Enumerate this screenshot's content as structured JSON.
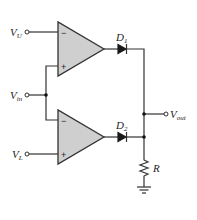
{
  "diagram": {
    "type": "window comparator circuit",
    "inputs": {
      "upper_ref": {
        "symbol": "V",
        "subscript": "U"
      },
      "signal": {
        "symbol": "V",
        "subscript": "in"
      },
      "lower_ref": {
        "symbol": "V",
        "subscript": "L"
      }
    },
    "output": {
      "symbol": "V",
      "subscript": "out"
    },
    "opamps": [
      {
        "id": "opamp-upper",
        "inverting_sign": "−",
        "noninverting_sign": "+"
      },
      {
        "id": "opamp-lower",
        "inverting_sign": "−",
        "noninverting_sign": "+"
      }
    ],
    "diodes": [
      {
        "id": "D1",
        "symbol": "D",
        "subscript": "1"
      },
      {
        "id": "D2",
        "symbol": "D",
        "subscript": "2"
      }
    ],
    "resistor": {
      "label": "R"
    },
    "colors": {
      "wire": "#333333",
      "opamp_fill": "#cfcfcf",
      "diode_fill": "#1a1a1a"
    }
  }
}
